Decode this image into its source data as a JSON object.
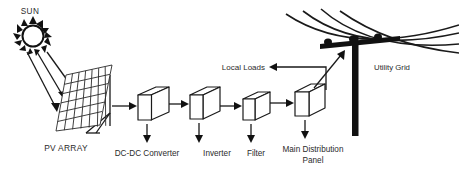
{
  "diagram": {
    "background_color": "#ffffff",
    "line_color": "#1a1a1a",
    "text_color": "#2b2b2b"
  },
  "labels": {
    "sun": "SUN",
    "pv_array": "PV ARRAY",
    "dcdc_converter": "DC-DC Converter",
    "inverter": "Inverter",
    "filter": "Filter",
    "main_distribution_panel_line1": "Main Distribution",
    "main_distribution_panel_line2": "Panel",
    "local_loads": "Local Loads",
    "utility_grid": "Utility Grid"
  },
  "blocks": [
    {
      "id": "dcdc-converter",
      "label": "DC-DC Converter",
      "x": 138,
      "y": 88
    },
    {
      "id": "inverter",
      "label": "Inverter",
      "x": 190,
      "y": 88
    },
    {
      "id": "filter",
      "label": "Filter",
      "x": 243,
      "y": 92
    },
    {
      "id": "main-distribution-panel",
      "label": "Main Distribution Panel",
      "x": 295,
      "y": 84
    }
  ],
  "signal_flow": [
    "PV ARRAY",
    "DC-DC Converter",
    "Inverter",
    "Filter",
    "Main Distribution Panel",
    "Utility Grid"
  ],
  "branches": [
    {
      "from": "Main Distribution Panel",
      "to": "Local Loads"
    },
    {
      "from": "Main Distribution Panel",
      "to": "Utility Grid"
    }
  ],
  "sun": {
    "ray_count": 3,
    "spike_count": 12,
    "target": "PV ARRAY"
  },
  "pv_panel": {
    "cell_columns": 7,
    "cell_rows": 6
  },
  "utility_pole": {
    "insulator_count": 3,
    "power_line_count": 4
  }
}
